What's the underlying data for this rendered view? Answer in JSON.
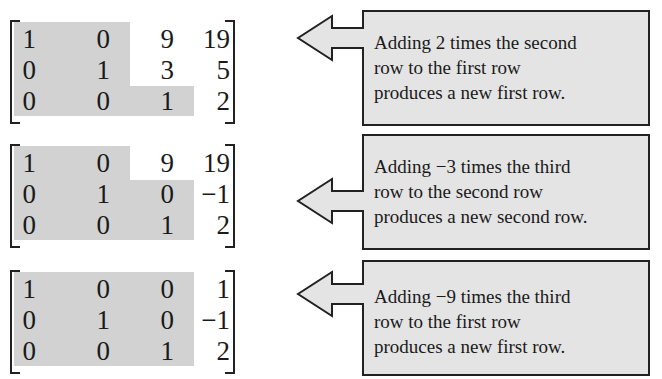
{
  "steps": [
    {
      "matrix": [
        [
          "1",
          "0",
          "9",
          "19"
        ],
        [
          "0",
          "1",
          "3",
          "5"
        ],
        [
          "0",
          "0",
          "1",
          "2"
        ]
      ],
      "note": [
        "Adding 2 times the second",
        "row to the first row",
        "produces a new first row."
      ]
    },
    {
      "matrix": [
        [
          "1",
          "0",
          "9",
          "19"
        ],
        [
          "0",
          "1",
          "0",
          "−1"
        ],
        [
          "0",
          "0",
          "1",
          "2"
        ]
      ],
      "note": [
        "Adding −3 times the third",
        "row to the second row",
        "produces a new second row."
      ]
    },
    {
      "matrix": [
        [
          "1",
          "0",
          "0",
          "1"
        ],
        [
          "0",
          "1",
          "0",
          "−1"
        ],
        [
          "0",
          "0",
          "1",
          "2"
        ]
      ],
      "note": [
        "Adding −9 times the third",
        "row to the first row",
        "produces a new first row."
      ]
    }
  ],
  "colors": {
    "shade": "#d2d2d2",
    "callout_fill": "#e4e4e4",
    "stroke": "#222222"
  }
}
